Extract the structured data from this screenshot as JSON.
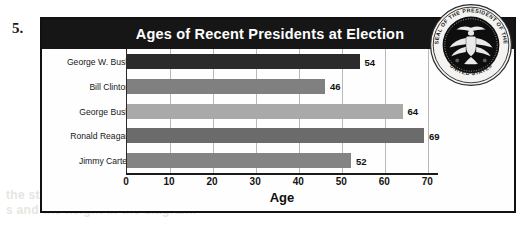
{
  "question_number": "5.",
  "chart": {
    "title": "Ages of Recent Presidents at Election",
    "seal": {
      "name": "presidential-seal",
      "text_top": "SEAL OF THE PRESIDENT OF THE",
      "text_bottom": "UNITED STATES"
    }
  },
  "page_bleed": {
    "line1": "the statement as an equation",
    "line2": "s and the height in the diagram."
  },
  "chart_data": {
    "type": "bar",
    "orientation": "horizontal",
    "title": "Ages of Recent Presidents at Election",
    "xlabel": "Age",
    "ylabel": "",
    "categories": [
      "George W. Bush",
      "Bill Clinton",
      "George Bush",
      "Ronald Reagan",
      "Jimmy Carter"
    ],
    "values": [
      54,
      46,
      64,
      69,
      52
    ],
    "value_labels": [
      "54",
      "46",
      "64",
      "69",
      "52"
    ],
    "bar_colors": [
      "#2b2b2b",
      "#808080",
      "#a9a9a9",
      "#6b6b6b",
      "#848484"
    ],
    "xlim": [
      0,
      72
    ],
    "xticks": [
      0,
      10,
      20,
      30,
      40,
      50,
      60,
      70
    ],
    "xtick_labels": [
      "0",
      "10",
      "20",
      "30",
      "40",
      "50",
      "60",
      "70"
    ],
    "grid": true,
    "grid_axis": "x",
    "legend": false,
    "title_background": "#161616",
    "title_color": "#ffffff"
  }
}
